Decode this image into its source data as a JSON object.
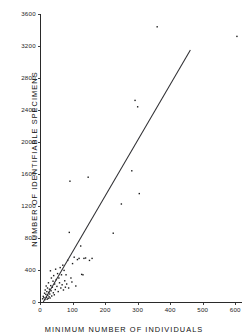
{
  "figure": {
    "background_color": "#ffffff",
    "ink_color": "#1a1a1a",
    "line_color": "#2f2f33"
  },
  "chart_data": {
    "type": "scatter",
    "title": "",
    "subtitle": "",
    "xlabel": "MINIMUM NUMBER OF INDIVIDUALS",
    "ylabel": "NUMBER OF IDENTIFIABLE SPECIMENS",
    "xlim": [
      0,
      620
    ],
    "ylim": [
      0,
      3700
    ],
    "xticks": [
      0,
      100,
      200,
      300,
      400,
      500,
      600
    ],
    "yticks": [
      0,
      400,
      800,
      1200,
      1600,
      2000,
      2400,
      2800,
      3200,
      3600
    ],
    "xticklabels": [
      "0",
      "100",
      "200",
      "300",
      "400",
      "500",
      "600"
    ],
    "yticklabels": [
      "0",
      "400",
      "800",
      "1200",
      "1600",
      "2000",
      "2400",
      "2800",
      "3200",
      "3600"
    ],
    "grid": false,
    "legend": null,
    "legend_position": "none",
    "marker": "small-dot",
    "series": [
      {
        "name": "assemblages",
        "points": [
          [
            8,
            40
          ],
          [
            10,
            70
          ],
          [
            12,
            55
          ],
          [
            14,
            110
          ],
          [
            15,
            30
          ],
          [
            16,
            150
          ],
          [
            18,
            95
          ],
          [
            19,
            200
          ],
          [
            20,
            60
          ],
          [
            21,
            130
          ],
          [
            22,
            35
          ],
          [
            23,
            175
          ],
          [
            24,
            85
          ],
          [
            25,
            45
          ],
          [
            26,
            240
          ],
          [
            27,
            120
          ],
          [
            28,
            65
          ],
          [
            29,
            160
          ],
          [
            30,
            100
          ],
          [
            31,
            50
          ],
          [
            32,
            390
          ],
          [
            33,
            205
          ],
          [
            34,
            140
          ],
          [
            35,
            300
          ],
          [
            36,
            75
          ],
          [
            38,
            185
          ],
          [
            40,
            260
          ],
          [
            41,
            115
          ],
          [
            42,
            330
          ],
          [
            44,
            90
          ],
          [
            45,
            225
          ],
          [
            47,
            155
          ],
          [
            48,
            410
          ],
          [
            50,
            280
          ],
          [
            52,
            195
          ],
          [
            54,
            355
          ],
          [
            56,
            130
          ],
          [
            58,
            300
          ],
          [
            60,
            240
          ],
          [
            62,
            430
          ],
          [
            64,
            175
          ],
          [
            66,
            340
          ],
          [
            68,
            215
          ],
          [
            70,
            460
          ],
          [
            72,
            150
          ],
          [
            74,
            395
          ],
          [
            76,
            265
          ],
          [
            78,
            185
          ],
          [
            80,
            340
          ],
          [
            82,
            225
          ],
          [
            85,
            520
          ],
          [
            88,
            175
          ],
          [
            90,
            870
          ],
          [
            92,
            1510
          ],
          [
            95,
            300
          ],
          [
            98,
            250
          ],
          [
            100,
            480
          ],
          [
            105,
            560
          ],
          [
            110,
            200
          ],
          [
            115,
            530
          ],
          [
            120,
            545
          ],
          [
            125,
            700
          ],
          [
            128,
            345
          ],
          [
            132,
            340
          ],
          [
            135,
            545
          ],
          [
            140,
            550
          ],
          [
            148,
            1560
          ],
          [
            152,
            520
          ],
          [
            160,
            545
          ],
          [
            225,
            860
          ],
          [
            250,
            1225
          ],
          [
            282,
            1640
          ],
          [
            292,
            2520
          ],
          [
            300,
            2440
          ],
          [
            305,
            1355
          ],
          [
            360,
            3440
          ],
          [
            605,
            3320
          ]
        ]
      }
    ],
    "fit_line": {
      "name": "least-squares regression",
      "x_start": 10,
      "y_start": 0,
      "x_end": 462,
      "y_end": 3150
    }
  }
}
